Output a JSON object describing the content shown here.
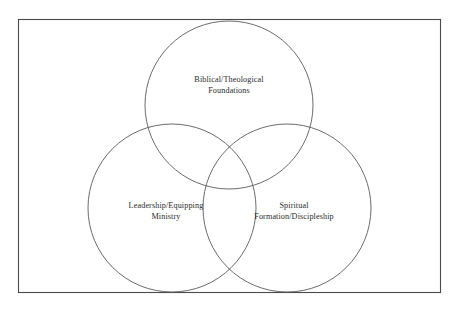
{
  "diagram": {
    "type": "venn-3-circle",
    "title": "",
    "background_color": "#ffffff",
    "frame": {
      "name": "outer-border",
      "x": 18,
      "y": 19,
      "width": 423,
      "height": 274,
      "stroke_color": "#4a4a4a"
    },
    "stroke_color": "#5a5a5a",
    "text_color": "#2b2b2b",
    "sets": [
      {
        "id": "biblical-theological-foundations",
        "position": "top",
        "cx": 229,
        "cy": 105,
        "r": 84,
        "label_lines": [
          "Biblical/Theological",
          "Foundations"
        ],
        "label_full": "Biblical/Theological Foundations"
      },
      {
        "id": "leadership-equipping-ministry",
        "position": "bottom-left",
        "cx": 172,
        "cy": 208,
        "r": 84,
        "label_lines": [
          "Leadership/Equipping",
          "Ministry"
        ],
        "label_full": "Leadership/Equipping Ministry"
      },
      {
        "id": "spiritual-formation-discipleship",
        "position": "bottom-right",
        "cx": 287,
        "cy": 208,
        "r": 84,
        "label_lines": [
          "Spiritual",
          "Formation/Discipleship"
        ],
        "label_full": "Spiritual Formation/Discipleship"
      }
    ]
  }
}
